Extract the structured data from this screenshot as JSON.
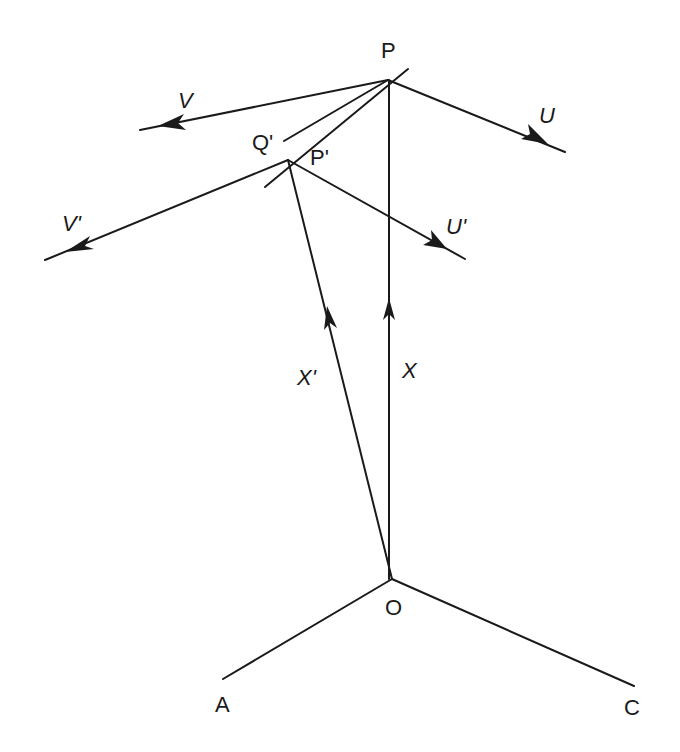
{
  "diagram": {
    "points": {
      "P": "P",
      "P_prime": "P'",
      "Q_prime": "Q'",
      "O": "O",
      "A": "A",
      "C": "C"
    },
    "vectors": {
      "U": "U",
      "V": "V",
      "U_prime": "U'",
      "V_prime": "V'",
      "X": "X",
      "X_prime": "X'"
    },
    "colors": {
      "ink": "#1a1a1a",
      "background": "#ffffff"
    }
  }
}
